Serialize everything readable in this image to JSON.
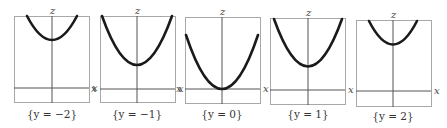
{
  "figure": {
    "axis_labels": {
      "vertical": "z",
      "horizontal": "x"
    },
    "panels": [
      {
        "caption": "{y = −2}",
        "y_value": -2,
        "vertex_z": 4
      },
      {
        "caption": "{y = −1}",
        "y_value": -1,
        "vertex_z": 1
      },
      {
        "caption": "{y = 0}",
        "y_value": 0,
        "vertex_z": 0
      },
      {
        "caption": "{y = 1}",
        "y_value": 1,
        "vertex_z": 1
      },
      {
        "caption": "{y = 2}",
        "y_value": 2,
        "vertex_z": 4
      }
    ]
  },
  "colors": {
    "frame": "#a8a8a8",
    "axis": "#555555",
    "curve": "#1a1a1a"
  }
}
